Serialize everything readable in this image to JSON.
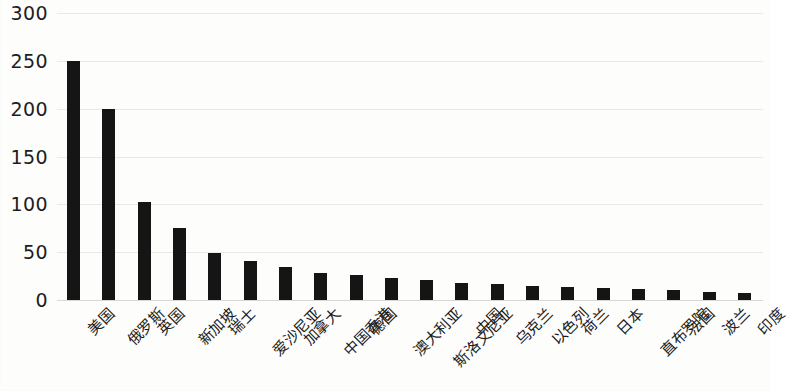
{
  "chart_data": {
    "type": "bar",
    "title": "",
    "subtitle": "",
    "xlabel": "",
    "ylabel": "",
    "ylim": [
      0,
      300
    ],
    "ytick_labels": [
      "300",
      "250",
      "200",
      "150",
      "100",
      "50",
      "0"
    ],
    "ytick_values": [
      300,
      250,
      200,
      150,
      100,
      50,
      0
    ],
    "grid": true,
    "legend": false,
    "bar_color": "#151515",
    "background_color": "#fdfdfc",
    "gridline_color": "#e9e9e6",
    "categories": [
      "美国",
      "俄罗斯",
      "英国",
      "新加坡",
      "瑞士",
      "爱沙尼亚",
      "加拿大",
      "中国香港",
      "德国",
      "澳大利亚",
      "斯洛文尼亚",
      "中国",
      "乌克兰",
      "以色列",
      "荷兰",
      "日本",
      "直布罗陀",
      "法国",
      "波兰",
      "印度"
    ],
    "values": [
      250,
      200,
      102,
      75,
      49,
      41,
      34,
      28,
      26,
      23,
      21,
      18,
      17,
      15,
      14,
      13,
      12,
      10,
      8,
      7
    ]
  }
}
